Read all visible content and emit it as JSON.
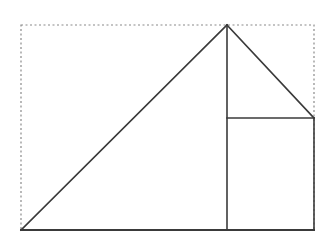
{
  "diagram": {
    "canvas": {
      "width": 329,
      "height": 233,
      "background": "#ffffff"
    },
    "colors": {
      "solid_stroke": "#3a3a3a",
      "dotted_stroke": "#8a8a8a"
    },
    "bounding_box": {
      "x": 21,
      "y": 25,
      "width": 293,
      "height": 205,
      "style": "dotted"
    },
    "points": {
      "bottom_left": [
        21,
        230
      ],
      "apex": [
        227,
        25
      ],
      "right_upper": [
        314,
        118
      ],
      "mid_foot": [
        227,
        230
      ],
      "mid_upper": [
        227,
        118
      ],
      "bottom_right": [
        314,
        230
      ]
    },
    "segments": [
      {
        "name": "hypotenuse-left",
        "from": "bottom_left",
        "to": "apex"
      },
      {
        "name": "slant-right",
        "from": "apex",
        "to": "right_upper"
      },
      {
        "name": "vertical-center",
        "from": "apex",
        "to": "mid_foot"
      },
      {
        "name": "horizontal-inner",
        "from": "mid_upper",
        "to": "right_upper"
      },
      {
        "name": "vertical-right",
        "from": "right_upper",
        "to": "bottom_right"
      },
      {
        "name": "base",
        "from": "bottom_left",
        "to": "bottom_right"
      }
    ]
  }
}
